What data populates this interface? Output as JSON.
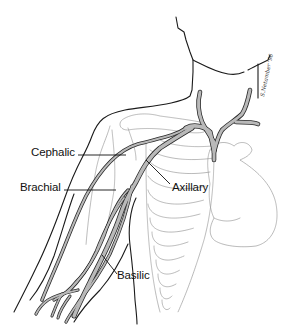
{
  "figure": {
    "vein_color": "#b9b9b9",
    "outline_color": "#1a1a1a",
    "skeleton_color": "#8a8a8a"
  },
  "labels": {
    "cephalic": "Cephalic",
    "brachial": "Brachial",
    "axillary": "Axillary",
    "basilic": "Basilic"
  },
  "signature": "S.Netamber '96",
  "icons": {
    "veins": "vein-network-illustration",
    "ribcage": "ribcage-illustration",
    "heart": "heart-illustration",
    "body": "torso-arm-outline-illustration"
  }
}
